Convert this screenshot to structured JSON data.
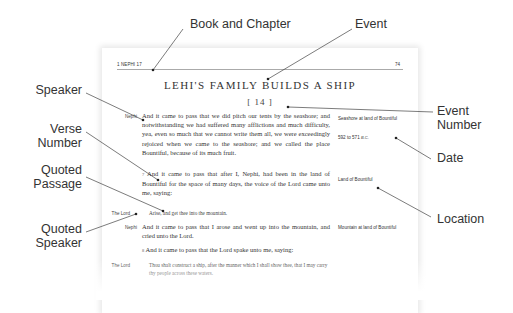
{
  "page": {
    "header_left": "1 NEPHI 17",
    "header_right": "74",
    "title": "LEHI'S FAMILY BUILDS A SHIP",
    "event_number": "[ 14 ]",
    "blocks": [
      {
        "speaker": "Nephi",
        "verse": "",
        "text": "And it came to pass that we did pitch our tents by the seashore; and notwithstanding we had suffered many afflictions and much difficulty, yea, even so much that we cannot write them all, we were exceedingly rejoiced when we came to the seashore; and we called the place Bountiful, because of its much fruit."
      },
      {
        "speaker": "",
        "verse": "7",
        "text": "And it came to pass that after I, Nephi, had been in the land of Bountiful for the space of many days, the voice of the Lord came unto me, saying:"
      },
      {
        "speaker": "The Lord",
        "verse": "",
        "text": "Arise, and get thee into the mountain."
      },
      {
        "speaker": "Nephi",
        "verse": "",
        "text": "And it came to pass that I arose and went up into the mountain, and cried unto the Lord."
      },
      {
        "speaker": "",
        "verse": "8",
        "text": "And it came to pass that the Lord spake unto me, saying:"
      },
      {
        "speaker": "The Lord",
        "verse": "",
        "text": "Thou shalt construct a ship, after the manner which I shall show thee, that I may carry thy people across these waters."
      }
    ],
    "sidebar": {
      "location1": "Seashore at land of Bountiful",
      "date1": "592 to 571",
      "date1_era": "B.C.",
      "location2": "Land of Bountiful",
      "location3": "Mountain at land of Bountiful"
    }
  },
  "annotations": {
    "book_and_chapter": "Book and Chapter",
    "event": "Event",
    "speaker": "Speaker",
    "verse_number_1": "Verse",
    "verse_number_2": "Number",
    "quoted_passage_1": "Quoted",
    "quoted_passage_2": "Passage",
    "quoted_speaker_1": "Quoted",
    "quoted_speaker_2": "Speaker",
    "event_number_1": "Event",
    "event_number_2": "Number",
    "date": "Date",
    "location": "Location"
  },
  "colors": {
    "leader_line": "#444444",
    "text": "#333333"
  }
}
